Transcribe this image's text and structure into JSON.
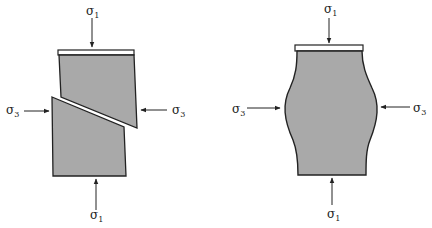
{
  "figures": [
    {
      "name": "brittle-shear-failure",
      "labels": {
        "top": "σ",
        "top_sub": "1",
        "bottom": "σ",
        "bottom_sub": "1",
        "left": "σ",
        "left_sub": "3",
        "right": "σ",
        "right_sub": "3"
      }
    },
    {
      "name": "ductile-barreling",
      "labels": {
        "top": "σ",
        "top_sub": "1",
        "bottom": "σ",
        "bottom_sub": "1",
        "left": "σ",
        "left_sub": "3",
        "right": "σ",
        "right_sub": "3"
      }
    }
  ],
  "colors": {
    "fill": "#a9a9a9",
    "stroke": "#222222",
    "background": "#ffffff"
  }
}
